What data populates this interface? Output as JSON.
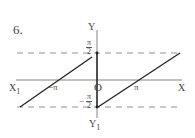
{
  "problem_number": "6.",
  "axes": {
    "x_label": "X",
    "x_neg_label": "X",
    "x_neg_sub": "1",
    "y_label": "Y",
    "y_neg_label": "Y",
    "y_neg_sub": "1",
    "origin_label": "O"
  },
  "ticks": {
    "neg_pi": "−π",
    "pi": "π",
    "top_num": "π",
    "top_den": "2",
    "bottom_sign": "−",
    "bottom_num": "π",
    "bottom_den": "2"
  },
  "colors": {
    "curve": "#222222",
    "axis": "#666666",
    "dash": "#777777"
  }
}
